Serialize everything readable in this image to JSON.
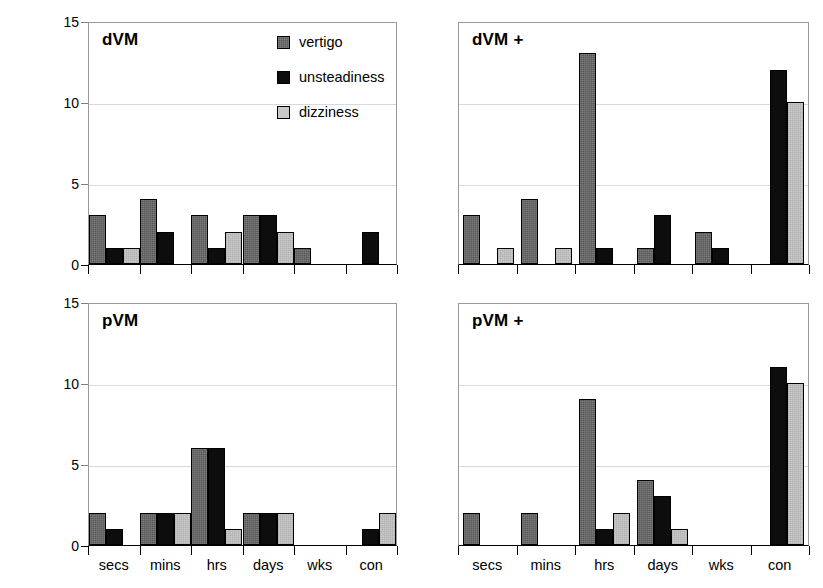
{
  "chart_data": {
    "type": "bar",
    "title": "",
    "xlabel": "",
    "ylabel": "Number of Subjects",
    "ylim": [
      0,
      15
    ],
    "yticks": [
      0,
      5,
      10,
      15
    ],
    "grid": true,
    "legend_position": "inside top-center of dVM panel",
    "categories": [
      "secs",
      "mins",
      "hrs",
      "days",
      "wks",
      "con"
    ],
    "series_names": [
      "vertigo",
      "unsteadiness",
      "dizziness"
    ],
    "series_colors": {
      "vertigo": "#595959",
      "unsteadiness": "#0d0d0d",
      "dizziness": "#c9c9c9"
    },
    "panels": [
      {
        "id": "dvm",
        "title": "dVM",
        "series": [
          {
            "name": "vertigo",
            "values": [
              3,
              4,
              3,
              3,
              1,
              0
            ]
          },
          {
            "name": "unsteadiness",
            "values": [
              1,
              2,
              1,
              3,
              0,
              2
            ]
          },
          {
            "name": "dizziness",
            "values": [
              1,
              0,
              2,
              2,
              0,
              0
            ]
          }
        ]
      },
      {
        "id": "dvm-plus",
        "title": "dVM +",
        "series": [
          {
            "name": "vertigo",
            "values": [
              3,
              4,
              13,
              1,
              2,
              0
            ]
          },
          {
            "name": "unsteadiness",
            "values": [
              0,
              0,
              1,
              3,
              1,
              12
            ]
          },
          {
            "name": "dizziness",
            "values": [
              1,
              1,
              0,
              0,
              0,
              10
            ]
          }
        ]
      },
      {
        "id": "pvm",
        "title": "pVM",
        "series": [
          {
            "name": "vertigo",
            "values": [
              2,
              2,
              6,
              2,
              0,
              0
            ]
          },
          {
            "name": "unsteadiness",
            "values": [
              1,
              2,
              6,
              2,
              0,
              1
            ]
          },
          {
            "name": "dizziness",
            "values": [
              0,
              2,
              1,
              2,
              0,
              2
            ]
          }
        ]
      },
      {
        "id": "pvm-plus",
        "title": "pVM +",
        "series": [
          {
            "name": "vertigo",
            "values": [
              2,
              2,
              9,
              4,
              0,
              0
            ]
          },
          {
            "name": "unsteadiness",
            "values": [
              0,
              0,
              1,
              3,
              0,
              11
            ]
          },
          {
            "name": "dizziness",
            "values": [
              0,
              0,
              2,
              1,
              0,
              10
            ]
          }
        ]
      }
    ]
  },
  "axis": {
    "ylabel": "Number of Subjects",
    "ytick_labels": [
      "15",
      "10",
      "5",
      "0"
    ],
    "xtick_labels": [
      "secs",
      "mins",
      "hrs",
      "days",
      "wks",
      "con"
    ]
  },
  "legend": {
    "items": [
      {
        "label": "vertigo",
        "swatch": "vertigo-swatch"
      },
      {
        "label": "unsteadiness",
        "swatch": "unsteadiness-swatch"
      },
      {
        "label": "dizziness",
        "swatch": "dizziness-swatch"
      }
    ]
  },
  "panel_titles": {
    "top_left": "dVM",
    "top_right": "dVM +",
    "bottom_left": "pVM",
    "bottom_right": "pVM +"
  }
}
